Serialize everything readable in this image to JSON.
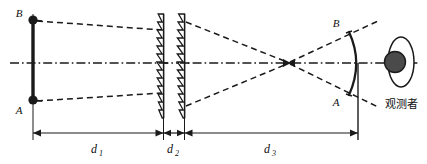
{
  "figure": {
    "type": "optical-ray-diagram",
    "caption": "",
    "background_color": "#ffffff",
    "ink_color": "#1a1a1a"
  },
  "object": {
    "name": "object-arrow",
    "top_label": "B",
    "bottom_label": "A",
    "top_point_label": "B",
    "bottom_point_label": "A"
  },
  "image": {
    "name": "virtual-image-arc",
    "top_label": "B",
    "bottom_label": "A"
  },
  "optics": {
    "lens1_name": "fresnel-lens-1",
    "lens2_name": "fresnel-lens-2",
    "axis_name": "optical-axis"
  },
  "observer": {
    "label": "观测者",
    "eye_name": "observer-eye"
  },
  "dimensions": [
    {
      "id": "d1",
      "symbol": "d",
      "subscript": "1"
    },
    {
      "id": "d2",
      "symbol": "d",
      "subscript": "2"
    },
    {
      "id": "d3",
      "symbol": "d",
      "subscript": "3"
    }
  ],
  "labels": {
    "d1_symbol": "d",
    "d1_sub": "1",
    "d2_symbol": "d",
    "d2_sub": "2",
    "d3_symbol": "d",
    "d3_sub": "3",
    "object_B": "B",
    "object_A": "A",
    "image_B": "B",
    "image_A": "A",
    "observer_text": "观测者"
  }
}
